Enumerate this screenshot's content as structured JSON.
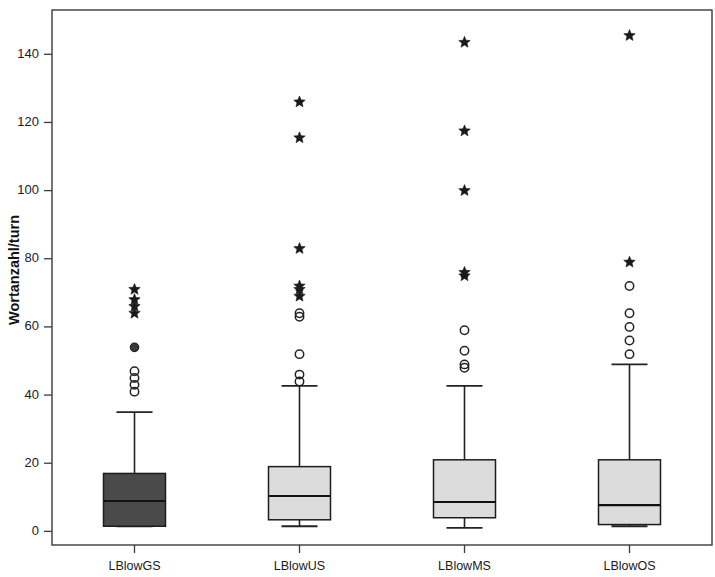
{
  "chart_data": {
    "type": "box",
    "title": "",
    "xlabel": "",
    "ylabel": "Wortanzahl/turn",
    "ylim": [
      -4,
      153
    ],
    "yticks": [
      0,
      20,
      40,
      60,
      80,
      100,
      120,
      140
    ],
    "ytick_labels": [
      "0",
      "20",
      "40",
      "60",
      "80",
      "100",
      "120",
      "140"
    ],
    "grid": false,
    "legend": "none",
    "categories": [
      "LBlowGS",
      "LBlowUS",
      "LBlowMS",
      "LBlowOS"
    ],
    "series": [
      {
        "name": "LBlowGS",
        "fill": "#4a4a4a",
        "whisker_low": 1.5,
        "q1": 1.5,
        "median": 8.9,
        "q3": 17.0,
        "whisker_high": 35.0,
        "mild_outliers": [
          41.0,
          43.0,
          45.0,
          47.0,
          54.0
        ],
        "extreme_outliers": [
          64.0,
          66.0,
          68.0,
          71.0
        ]
      },
      {
        "name": "LBlowUS",
        "fill": "#dcdcdc",
        "whisker_low": 1.5,
        "q1": 3.4,
        "median": 10.4,
        "q3": 19.0,
        "whisker_high": 42.7,
        "mild_outliers": [
          44.0,
          46.0,
          52.0,
          63.0,
          64.0
        ],
        "extreme_outliers": [
          69.0,
          71.0,
          72.0,
          83.0,
          115.5,
          126.0
        ]
      },
      {
        "name": "LBlowMS",
        "fill": "#dcdcdc",
        "whisker_low": 1.0,
        "q1": 4.0,
        "median": 8.6,
        "q3": 21.0,
        "whisker_high": 42.7,
        "mild_outliers": [
          48.0,
          49.0,
          53.0,
          59.0
        ],
        "extreme_outliers": [
          75.0,
          76.0,
          100.0,
          117.5,
          143.5
        ]
      },
      {
        "name": "LBlowOS",
        "fill": "#dcdcdc",
        "whisker_low": 1.5,
        "q1": 2.0,
        "median": 7.7,
        "q3": 21.0,
        "whisker_high": 49.0,
        "mild_outliers": [
          52.0,
          56.0,
          60.0,
          64.0,
          72.0
        ],
        "extreme_outliers": [
          79.0,
          145.5
        ]
      }
    ]
  },
  "axes": {
    "y_title": "Wortanzahl/turn"
  }
}
